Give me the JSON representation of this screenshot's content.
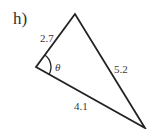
{
  "problem_label": "h)",
  "triangle": {
    "vertices": {
      "top": [
        75,
        14
      ],
      "left": [
        36,
        67
      ],
      "bottom_right": [
        145,
        128
      ]
    },
    "sides": [
      {
        "name": "top-left",
        "label": "2.7"
      },
      {
        "name": "top-bottom_right",
        "label": "5.2"
      },
      {
        "name": "left-bottom_right",
        "label": "4.1"
      }
    ],
    "angle": {
      "vertex": "left",
      "label": "θ"
    }
  },
  "colors": {
    "stroke": "#222222",
    "text": "#3a3a3a"
  }
}
